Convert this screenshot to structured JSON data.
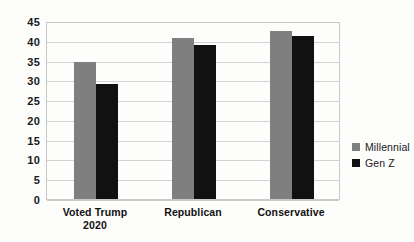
{
  "chart_data": {
    "type": "bar",
    "title": "",
    "subtitle": "",
    "xlabel": "",
    "ylabel": "",
    "categories": [
      "Voted Trump 2020",
      "Republican",
      "Conservative"
    ],
    "category_lines": [
      [
        "Voted Trump",
        "2020"
      ],
      [
        "Republican"
      ],
      [
        "Conservative"
      ]
    ],
    "series": [
      {
        "name": "Millennial",
        "color": "#7f7f7f",
        "values": [
          34.7,
          40.8,
          42.5
        ]
      },
      {
        "name": "Gen Z",
        "color": "#111111",
        "values": [
          29.2,
          38.9,
          41.1
        ]
      }
    ],
    "ylim": [
      0,
      45
    ],
    "yticks": [
      0,
      5,
      10,
      15,
      20,
      25,
      30,
      35,
      40,
      45
    ],
    "ytick_labels": [
      "0",
      "5",
      "10",
      "15",
      "20",
      "25",
      "30",
      "35",
      "40",
      "45"
    ],
    "grid": true,
    "grid_axis": "y",
    "legend_position": "right",
    "legend": [
      {
        "label": "Millennial",
        "color": "#7f7f7f",
        "swatch": "square-swatch-icon"
      },
      {
        "label": "Gen Z",
        "color": "#111111",
        "swatch": "square-swatch-icon"
      }
    ],
    "colors": {
      "millennial": "#7f7f7f",
      "genz": "#111111",
      "gridline": "#d2d2d2",
      "frame": "#c9c9c9",
      "background": "#fdfdfc",
      "text": "#111111"
    }
  }
}
